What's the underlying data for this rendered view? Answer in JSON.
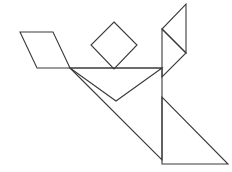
{
  "figure": {
    "background_color": "#ffffff",
    "stroke_color": "#3a3a3a",
    "stroke_width": 1.1,
    "canvas": {
      "width": 232,
      "height": 172
    }
  },
  "pieces": [
    {
      "name": "parallelogram",
      "label": "Parallelogram",
      "points": "20,32 53,32 70,68 37,68"
    },
    {
      "name": "small-square",
      "label": "Square",
      "points": "114,22 137,45 114,69 91,45"
    },
    {
      "name": "small-triangle-upper-right",
      "label": "Small triangle (upper right)",
      "points": "186,4 186,53 162,29"
    },
    {
      "name": "small-triangle-mid-right",
      "label": "Small triangle (middle right)",
      "points": "162,29 186,53 162,77"
    },
    {
      "name": "medium-triangle-center",
      "label": "Medium triangle (center)",
      "points": "70,68 162,68 116,101"
    },
    {
      "name": "large-triangle-center",
      "label": "Large triangle (center)",
      "points": "70,68 162,160 162,68"
    },
    {
      "name": "large-triangle-lower-right",
      "label": "Large triangle (lower right)",
      "points": "162,97 162,164 228,164"
    }
  ]
}
